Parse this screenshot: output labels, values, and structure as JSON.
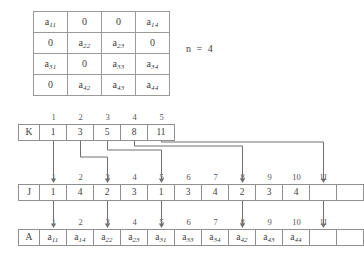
{
  "matrix": {
    "caption": "n = 4",
    "n": 4,
    "rows": [
      [
        "a11",
        "0",
        "0",
        "a14"
      ],
      [
        "0",
        "a22",
        "a23",
        "0"
      ],
      [
        "a31",
        "0",
        "a33",
        "a34"
      ],
      [
        "0",
        "a42",
        "a43",
        "a44"
      ]
    ],
    "cells": [
      [
        {
          "base": "a",
          "sub": "11"
        },
        {
          "base": "0",
          "sub": ""
        },
        {
          "base": "0",
          "sub": ""
        },
        {
          "base": "a",
          "sub": "14"
        }
      ],
      [
        {
          "base": "0",
          "sub": ""
        },
        {
          "base": "a",
          "sub": "22"
        },
        {
          "base": "a",
          "sub": "23"
        },
        {
          "base": "0",
          "sub": ""
        }
      ],
      [
        {
          "base": "a",
          "sub": "31"
        },
        {
          "base": "0",
          "sub": ""
        },
        {
          "base": "a",
          "sub": "33"
        },
        {
          "base": "a",
          "sub": "34"
        }
      ],
      [
        {
          "base": "0",
          "sub": ""
        },
        {
          "base": "a",
          "sub": "42"
        },
        {
          "base": "a",
          "sub": "43"
        },
        {
          "base": "a",
          "sub": "44"
        }
      ]
    ]
  },
  "k_array": {
    "label": "K",
    "indices": [
      "1",
      "2",
      "3",
      "4",
      "5"
    ],
    "values": [
      "1",
      "3",
      "5",
      "8",
      "11"
    ]
  },
  "j_array": {
    "label": "J",
    "indices": [
      "1",
      "2",
      "3",
      "4",
      "5",
      "6",
      "7",
      "8",
      "9",
      "10",
      "11"
    ],
    "values": [
      "1",
      "4",
      "2",
      "3",
      "1",
      "3",
      "4",
      "2",
      "3",
      "4",
      ""
    ]
  },
  "a_array": {
    "label": "A",
    "indices": [
      "1",
      "2",
      "3",
      "4",
      "5",
      "6",
      "7",
      "8",
      "9",
      "10",
      "11"
    ],
    "values": [
      {
        "base": "a",
        "sub": "11"
      },
      {
        "base": "a",
        "sub": "14"
      },
      {
        "base": "a",
        "sub": "22"
      },
      {
        "base": "a",
        "sub": "23"
      },
      {
        "base": "a",
        "sub": "31"
      },
      {
        "base": "a",
        "sub": "33"
      },
      {
        "base": "a",
        "sub": "34"
      },
      {
        "base": "a",
        "sub": "42"
      },
      {
        "base": "a",
        "sub": "43"
      },
      {
        "base": "a",
        "sub": "44"
      },
      {
        "base": "",
        "sub": ""
      }
    ]
  },
  "pointers": {
    "description": "K entries point to start positions in J and A",
    "targets": [
      "1",
      "3",
      "5",
      "8",
      "11"
    ]
  },
  "colors": {
    "line": "#8f8f8f",
    "text": "#3d3d3d",
    "wire": "#6f6f6f"
  }
}
